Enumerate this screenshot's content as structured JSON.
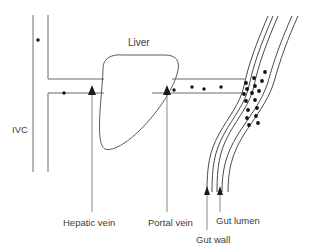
{
  "diagram": {
    "title_visible": false,
    "background_color": "#ffffff",
    "line_color": "#6b6b6b",
    "particle_color": "#111111",
    "labels": {
      "ivc": "IVC",
      "liver": "Liver",
      "hepatic_vein": "Hepatic vein",
      "portal_vein": "Portal vein",
      "gut_wall": "Gut wall",
      "gut_lumen": "Gut lumen"
    },
    "label_positions": {
      "ivc": {
        "x": 12,
        "y": 133
      },
      "liver": {
        "x": 128,
        "y": 46
      },
      "hepatic_vein": {
        "x": 63,
        "y": 226
      },
      "portal_vein": {
        "x": 148,
        "y": 226
      },
      "gut_wall": {
        "x": 196,
        "y": 243
      },
      "gut_lumen": {
        "x": 216,
        "y": 224
      }
    },
    "structures": [
      {
        "name": "ivc",
        "kind": "vertical-vessel",
        "label": "IVC"
      },
      {
        "name": "liver",
        "kind": "organ-blob",
        "label": "Liver"
      },
      {
        "name": "hepatic-vein",
        "kind": "horizontal-vessel",
        "label": "Hepatic vein"
      },
      {
        "name": "portal-vein",
        "kind": "horizontal-vessel",
        "label": "Portal vein"
      },
      {
        "name": "gut-tube",
        "kind": "curved-tube",
        "label": "Gut wall"
      },
      {
        "name": "gut-lumen",
        "kind": "tube-interior",
        "label": "Gut lumen"
      }
    ],
    "particles": {
      "ivc": [
        {
          "x": 38,
          "y": 40
        }
      ],
      "hepatic_vein": [
        {
          "x": 64,
          "y": 93
        }
      ],
      "portal_vein": [
        {
          "x": 174,
          "y": 90
        },
        {
          "x": 192,
          "y": 87
        },
        {
          "x": 204,
          "y": 89
        },
        {
          "x": 221,
          "y": 87
        }
      ],
      "gut_wall": [
        {
          "x": 265,
          "y": 72
        },
        {
          "x": 254,
          "y": 78
        },
        {
          "x": 246,
          "y": 83
        },
        {
          "x": 247,
          "y": 89
        },
        {
          "x": 255,
          "y": 86
        },
        {
          "x": 262,
          "y": 81
        },
        {
          "x": 244,
          "y": 94
        },
        {
          "x": 252,
          "y": 93
        },
        {
          "x": 259,
          "y": 91
        },
        {
          "x": 246,
          "y": 101
        },
        {
          "x": 255,
          "y": 100
        },
        {
          "x": 248,
          "y": 110
        },
        {
          "x": 257,
          "y": 108
        },
        {
          "x": 247,
          "y": 118
        },
        {
          "x": 256,
          "y": 116
        },
        {
          "x": 249,
          "y": 125
        },
        {
          "x": 258,
          "y": 123
        }
      ]
    },
    "arrows": [
      {
        "name": "hepatic-vein-flow-arrow",
        "x": 92,
        "y": 93,
        "direction": "up"
      },
      {
        "name": "portal-vein-flow-arrow",
        "x": 167,
        "y": 93,
        "direction": "up"
      },
      {
        "name": "gut-wall-flow-arrow",
        "x": 207,
        "y": 192,
        "direction": "up"
      },
      {
        "name": "gut-lumen-flow-arrow",
        "x": 220,
        "y": 192,
        "direction": "up"
      }
    ]
  }
}
